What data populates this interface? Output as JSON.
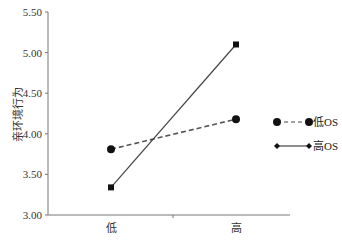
{
  "chart_data": {
    "type": "line",
    "title": "",
    "xlabel": "",
    "ylabel": "亲环境行为",
    "categories": [
      "低",
      "高"
    ],
    "ylim": [
      3.0,
      5.5
    ],
    "yticks": [
      "3.00",
      "3.50",
      "4.00",
      "4.50",
      "5.00",
      "5.50"
    ],
    "grid": false,
    "legend_position": "right",
    "series": [
      {
        "name": "低OS",
        "values": [
          3.81,
          4.18
        ],
        "marker": "circle",
        "line": "dashed",
        "color": "#111111"
      },
      {
        "name": "高OS",
        "values": [
          3.34,
          5.1
        ],
        "marker": "square",
        "line": "solid",
        "color": "#111111",
        "legend_marker": "diamond"
      }
    ]
  }
}
